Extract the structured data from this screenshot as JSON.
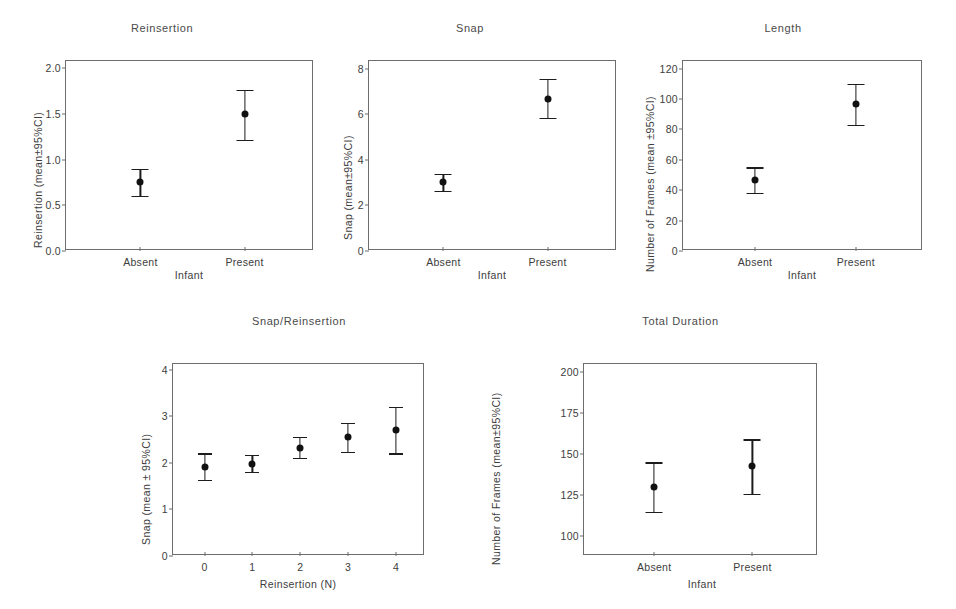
{
  "figure": {
    "background": "#ffffff",
    "marker_color": "#111111",
    "axis_color": "#6d6d6d"
  },
  "chart_data": [
    {
      "type": "scatter",
      "id": "reinsertion",
      "title": "Reinsertion",
      "xlabel": "Infant",
      "ylabel": "Reinsertion (mean±95%CI)",
      "categories": [
        "Absent",
        "Present"
      ],
      "values": [
        0.75,
        1.5
      ],
      "ci_low": [
        0.6,
        1.22
      ],
      "ci_high": [
        0.9,
        1.76
      ],
      "yticks": [
        "0.0",
        "0.5",
        "1.0",
        "1.5",
        "2.0"
      ],
      "ytick_values": [
        0.0,
        0.5,
        1.0,
        1.5,
        2.0
      ],
      "ylim": [
        0.0,
        2.08
      ],
      "grid": false,
      "legend": "none"
    },
    {
      "type": "scatter",
      "id": "snap",
      "title": "Snap",
      "xlabel": "Infant",
      "ylabel": "Snap (mean±95%CI)",
      "categories": [
        "Absent",
        "Present"
      ],
      "values": [
        3.05,
        6.7
      ],
      "ci_low": [
        2.65,
        5.85
      ],
      "ci_high": [
        3.4,
        7.55
      ],
      "yticks": [
        "0",
        "2",
        "4",
        "6",
        "8"
      ],
      "ytick_values": [
        0,
        2,
        4,
        6,
        8
      ],
      "ylim": [
        0,
        8.35
      ],
      "grid": false,
      "legend": "none"
    },
    {
      "type": "scatter",
      "id": "length",
      "title": "Length",
      "xlabel": "Infant",
      "ylabel": "Number of Frames (mean ±95%CI)",
      "categories": [
        "Absent",
        "Present"
      ],
      "values": [
        47,
        97
      ],
      "ci_low": [
        38,
        83
      ],
      "ci_high": [
        55,
        110
      ],
      "yticks": [
        "0",
        "20",
        "40",
        "60",
        "80",
        "100",
        "120"
      ],
      "ytick_values": [
        0,
        20,
        40,
        60,
        80,
        100,
        120
      ],
      "ylim": [
        0,
        125
      ],
      "grid": false,
      "legend": "none"
    },
    {
      "type": "scatter",
      "id": "snap-reinsertion",
      "title": "Snap/Reinsertion",
      "xlabel": "Reinsertion (N)",
      "ylabel": "Snap (mean ± 95%CI)",
      "categories": [
        "0",
        "1",
        "2",
        "3",
        "4"
      ],
      "x": [
        0,
        1,
        2,
        3,
        4
      ],
      "values": [
        1.92,
        1.98,
        2.32,
        2.55,
        2.7
      ],
      "ci_low": [
        1.63,
        1.8,
        2.1,
        2.23,
        2.2
      ],
      "ci_high": [
        2.2,
        2.17,
        2.55,
        2.85,
        3.2
      ],
      "yticks": [
        "0",
        "1",
        "2",
        "3",
        "4"
      ],
      "ytick_values": [
        0,
        1,
        2,
        3,
        4
      ],
      "ylim": [
        0,
        4.12
      ],
      "grid": false,
      "legend": "none"
    },
    {
      "type": "scatter",
      "id": "total-duration",
      "title": "Total Duration",
      "xlabel": "Infant",
      "ylabel": "Number of Frames (mean±95%CI)",
      "categories": [
        "Absent",
        "Present"
      ],
      "values": [
        130,
        143
      ],
      "ci_low": [
        115,
        126
      ],
      "ci_high": [
        145,
        159
      ],
      "yticks": [
        "100",
        "125",
        "150",
        "175",
        "200"
      ],
      "ytick_values": [
        100,
        125,
        150,
        175,
        200
      ],
      "ylim": [
        88,
        205
      ],
      "grid": false,
      "legend": "none"
    }
  ],
  "panels": {
    "p1": {
      "title": "Reinsertion",
      "ylabel": "Reinsertion (mean±95%CI)",
      "xlabel": "Infant",
      "yticks": [
        "2.0",
        "1.5",
        "1.0",
        "0.5",
        "0.0"
      ],
      "xticks": [
        "Absent",
        "Present"
      ]
    },
    "p2": {
      "title": "Snap",
      "ylabel": "Snap (mean±95%CI)",
      "xlabel": "Infant",
      "yticks": [
        "8",
        "6",
        "4",
        "2",
        "0"
      ],
      "xticks": [
        "Absent",
        "Present"
      ]
    },
    "p3": {
      "title": "Length",
      "ylabel": "Number of Frames (mean ±95%CI)",
      "xlabel": "Infant",
      "yticks": [
        "120",
        "100",
        "80",
        "60",
        "40",
        "20",
        "0"
      ],
      "xticks": [
        "Absent",
        "Present"
      ]
    },
    "p4": {
      "title": "Snap/Reinsertion",
      "ylabel": "Snap (mean ± 95%CI)",
      "xlabel": "Reinsertion (N)",
      "yticks": [
        "4",
        "3",
        "2",
        "1",
        "0"
      ],
      "xticks": [
        "0",
        "1",
        "2",
        "3",
        "4"
      ]
    },
    "p5": {
      "title": "Total Duration",
      "ylabel": "Number of Frames (mean±95%CI)",
      "xlabel": "Infant",
      "yticks": [
        "200",
        "175",
        "150",
        "125",
        "100"
      ],
      "xticks": [
        "Absent",
        "Present"
      ]
    }
  }
}
